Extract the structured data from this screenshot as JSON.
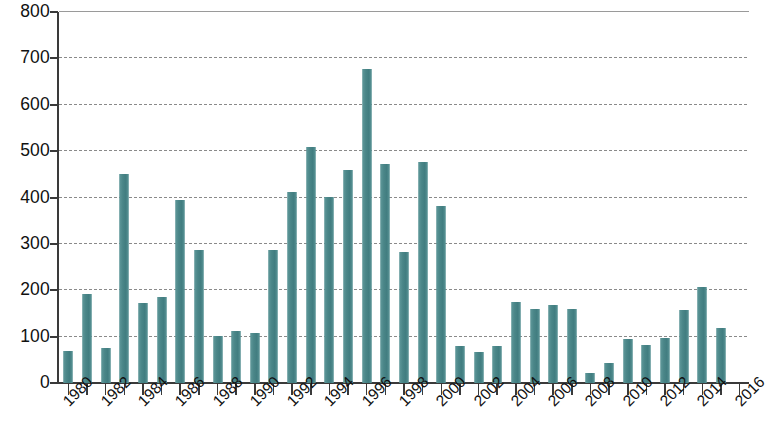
{
  "chart_data": {
    "type": "bar",
    "title": "",
    "subtitle": "",
    "xlabel": "",
    "ylabel": "",
    "ylim": [
      0,
      800
    ],
    "y_ticks": [
      0,
      100,
      200,
      300,
      400,
      500,
      600,
      700,
      800
    ],
    "y_tick_labels": [
      "0",
      "100",
      "200",
      "300",
      "400",
      "500",
      "600",
      "700",
      "800"
    ],
    "grid": true,
    "grid_axis": "y",
    "legend": "none",
    "bar_color": "#4e8b8d",
    "axis_color": "#3a3a3a",
    "grid_color": "#8a8a8a",
    "background": "#ffffff",
    "x_tick_labels": [
      "1980",
      "1982",
      "1984",
      "1986",
      "1988",
      "1990",
      "1992",
      "1994",
      "1996",
      "1998",
      "2000",
      "2002",
      "2004",
      "2006",
      "2008",
      "2010",
      "2012",
      "2014",
      "2016"
    ],
    "x_tick_label_rotation": -45,
    "x_tick_label_step": 2,
    "categories": [
      "1980",
      "1981",
      "1982",
      "1983",
      "1984",
      "1985",
      "1986",
      "1987",
      "1988",
      "1989",
      "1990",
      "1991",
      "1992",
      "1993",
      "1994",
      "1995",
      "1996",
      "1997",
      "1998",
      "1999",
      "2000",
      "2001",
      "2002",
      "2003",
      "2004",
      "2005",
      "2006",
      "2007",
      "2008",
      "2009",
      "2010",
      "2011",
      "2012",
      "2013",
      "2014",
      "2015",
      "2016"
    ],
    "values": [
      68,
      192,
      76,
      450,
      172,
      186,
      394,
      287,
      102,
      113,
      108,
      287,
      412,
      508,
      401,
      460,
      678,
      473,
      282,
      477,
      381,
      80,
      66,
      80,
      174,
      160,
      168,
      160,
      22,
      44,
      94,
      82,
      98,
      158,
      208,
      118,
      0
    ]
  }
}
